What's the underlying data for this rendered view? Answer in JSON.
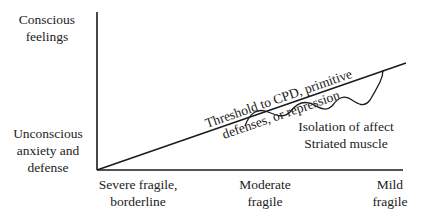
{
  "diagram": {
    "y_axis": {
      "top_label": [
        "Conscious",
        "feelings"
      ],
      "bottom_label": [
        "Unconscious",
        "anxiety and",
        "defense"
      ]
    },
    "x_axis": {
      "labels": [
        {
          "line1": "Severe fragile,",
          "line2": "borderline"
        },
        {
          "line1": "Moderate",
          "line2": "fragile"
        },
        {
          "line1": "Mild",
          "line2": "fragile"
        }
      ]
    },
    "threshold_line": {
      "label_line1": "Threshold to CPD, primitive",
      "label_line2": "defenses, or repression"
    },
    "wave_annotation": {
      "line1": "Isolation of affect",
      "line2": "Striated muscle"
    },
    "colors": {
      "line": "#1a1a1a",
      "text": "#222222",
      "background": "#ffffff"
    }
  }
}
